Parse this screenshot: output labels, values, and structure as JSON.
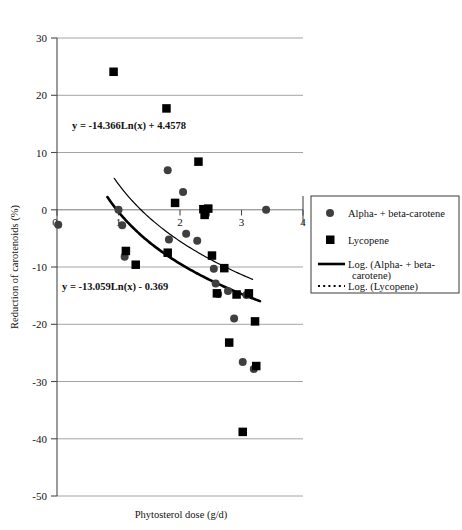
{
  "chart_data": {
    "type": "scatter",
    "title": "",
    "xlabel": "Phytosterol dose (g/d)",
    "ylabel": "Reduction of carotenoids (%)",
    "xlim": [
      0,
      4
    ],
    "ylim": [
      -50,
      30
    ],
    "xticks": [
      0,
      1,
      2,
      3,
      4
    ],
    "xtick_labels": [
      "0",
      "1",
      "2",
      "3",
      "4"
    ],
    "yticks": [
      30,
      20,
      10,
      0,
      -10,
      -20,
      -30,
      -40,
      -50
    ],
    "ytick_labels": [
      "30",
      "20",
      "10",
      "0",
      "-10",
      "-20",
      "-30",
      "-40",
      "-50"
    ],
    "grid": true,
    "grid_axis": "y",
    "legend_position": "right",
    "series": [
      {
        "name": "Alpha- + beta-carotene",
        "marker": "circle",
        "color": "#3f3f3f",
        "points": [
          [
            0.02,
            -2.6
          ],
          [
            1.0,
            0.0
          ],
          [
            1.06,
            -2.7
          ],
          [
            1.1,
            -8.2
          ],
          [
            1.8,
            6.9
          ],
          [
            1.82,
            -5.2
          ],
          [
            2.05,
            3.1
          ],
          [
            2.1,
            -4.2
          ],
          [
            2.28,
            -5.4
          ],
          [
            2.42,
            -0.8
          ],
          [
            2.55,
            -10.3
          ],
          [
            2.58,
            -12.9
          ],
          [
            2.62,
            -14.7
          ],
          [
            2.78,
            -14.2
          ],
          [
            2.88,
            -19.0
          ],
          [
            3.02,
            -26.6
          ],
          [
            3.08,
            -14.9
          ],
          [
            3.2,
            -27.8
          ],
          [
            3.4,
            0.0
          ]
        ]
      },
      {
        "name": "Lycopene",
        "marker": "square",
        "color": "#000000",
        "points": [
          [
            0.92,
            24.1
          ],
          [
            1.12,
            -7.2
          ],
          [
            1.28,
            -9.6
          ],
          [
            1.78,
            17.7
          ],
          [
            1.8,
            -7.5
          ],
          [
            1.92,
            1.2
          ],
          [
            2.3,
            8.4
          ],
          [
            2.38,
            0.1
          ],
          [
            2.4,
            -0.9
          ],
          [
            2.46,
            0.2
          ],
          [
            2.52,
            -8.0
          ],
          [
            2.6,
            -14.6
          ],
          [
            2.72,
            -10.2
          ],
          [
            2.8,
            -23.2
          ],
          [
            2.92,
            -14.8
          ],
          [
            3.02,
            -38.8
          ],
          [
            3.12,
            -14.6
          ],
          [
            3.22,
            -19.5
          ],
          [
            3.24,
            -27.3
          ]
        ]
      }
    ],
    "trendlines": [
      {
        "name": "Log. (Alpha- + beta-carotene)",
        "style": "thick-solid",
        "equation": "y = -13.059Ln(x) - 0.369",
        "coef_a": -13.059,
        "coef_b": -0.369,
        "x_range": [
          0.82,
          3.3
        ]
      },
      {
        "name": "Log. (Lycopene)",
        "style": "thin-solid",
        "equation": "y = -14.366Ln(x) + 4.4578",
        "coef_a": -14.366,
        "coef_b": 4.4578,
        "x_range": [
          0.93,
          3.18
        ]
      }
    ],
    "annotations": [
      {
        "id": "eq_lycopene",
        "text": "y = -14.366Ln(x) + 4.4578",
        "x_px": 72,
        "y_px": 129
      },
      {
        "id": "eq_carotene",
        "text": "y = -13.059Ln(x) - 0.369",
        "x_px": 62,
        "y_px": 290
      }
    ]
  },
  "legend": {
    "entries": [
      {
        "label": "Alpha- + beta-carotene",
        "symbol": "circle"
      },
      {
        "label": "Lycopene",
        "symbol": "square"
      },
      {
        "label": "Log. (Alpha- + beta-",
        "label2": "carotene)",
        "symbol": "solid-line"
      },
      {
        "label": "Log. (Lycopene)",
        "symbol": "dotted-line"
      }
    ]
  },
  "axes": {
    "x_title": "Phytosterol dose (g/d)",
    "y_title": "Reduction of carotenoids (%)"
  }
}
